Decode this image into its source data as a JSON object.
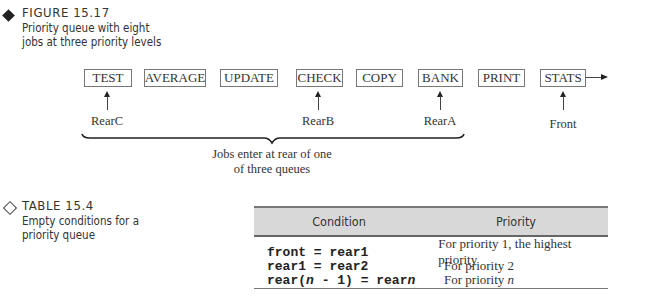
{
  "figure": {
    "label": "FIGURE 15.17",
    "caption_lines": [
      "Priority queue with eight",
      "jobs at three priority levels"
    ],
    "queue_items": [
      "TEST",
      "AVERAGE",
      "UPDATE",
      "CHECK",
      "COPY",
      "BANK",
      "PRINT",
      "STATS"
    ],
    "pointers": [
      {
        "label": "RearC",
        "points_to": "TEST"
      },
      {
        "label": "RearB",
        "points_to": "CHECK"
      },
      {
        "label": "RearA",
        "points_to": "BANK"
      },
      {
        "label": "Front",
        "points_to": "STATS"
      }
    ],
    "brace_note_lines": [
      "Jobs enter at rear of one",
      "of three queues"
    ]
  },
  "table": {
    "label": "TABLE 15.4",
    "caption_lines": [
      "Empty conditions for a",
      "priority queue"
    ],
    "headers": [
      "Condition",
      "Priority"
    ],
    "rows": [
      {
        "condition": "front = rear1",
        "priority": "For priority 1, the highest priority"
      },
      {
        "condition": "rear1 = rear2",
        "priority": "For priority 2"
      },
      {
        "condition_prefix": "rear(",
        "condition_var": "n",
        "condition_suffix": " - 1) = rear",
        "condition_var2": "n",
        "priority_prefix": "For priority ",
        "priority_var": "n"
      }
    ]
  }
}
